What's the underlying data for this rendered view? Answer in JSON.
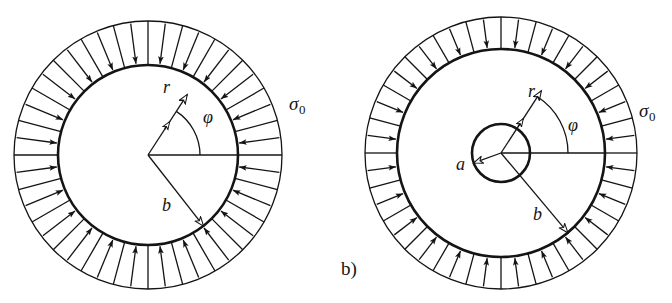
{
  "figure": {
    "caption_b": "b)",
    "panels": [
      {
        "id": "a",
        "name": "solid-disc-under-external-pressure",
        "center": [
          148,
          155
        ],
        "inner_radius": 90,
        "outer_radius": 134,
        "hole_radius": 0,
        "spoke_count": 24,
        "arrow_direction": "inward",
        "labels": {
          "sigma": "σ",
          "sigma_sub": "0",
          "r": "r",
          "phi": "φ",
          "b": "b"
        },
        "label_pos": {
          "sigma": [
            289,
            94
          ],
          "r": [
            163,
            78
          ],
          "phi": [
            203,
            108
          ],
          "b": [
            162,
            196
          ]
        },
        "vector_r": {
          "angle_deg": 57,
          "length": 72
        },
        "vector_b": {
          "angle_deg": -52,
          "length": 90
        },
        "angle_arc_deg": [
          0,
          57
        ]
      },
      {
        "id": "b",
        "name": "annulus-with-hole-under-external-pressure",
        "center": [
          501,
          153
        ],
        "inner_radius": 104,
        "outer_radius": 136,
        "hole_radius": 29,
        "spoke_count": 24,
        "arrow_direction": "inward",
        "labels": {
          "sigma": "σ",
          "sigma_sub": "0",
          "r": "r",
          "phi": "φ",
          "a": "a",
          "b": "b"
        },
        "label_pos": {
          "sigma": [
            639,
            101
          ],
          "r": [
            528,
            82
          ],
          "phi": [
            568,
            116
          ],
          "a": [
            456,
            155
          ],
          "b": [
            533,
            205
          ]
        },
        "vector_r": {
          "angle_deg": 57,
          "length": 74
        },
        "vector_b": {
          "angle_deg": -50,
          "length": 104
        },
        "vector_a": {
          "angle_deg": 200,
          "length": 29
        },
        "angle_arc_deg": [
          0,
          57
        ]
      }
    ],
    "style": {
      "line_color": "#141414",
      "thin_stroke": 1.3,
      "thick_stroke": 2.6,
      "background": "#ffffff"
    }
  }
}
